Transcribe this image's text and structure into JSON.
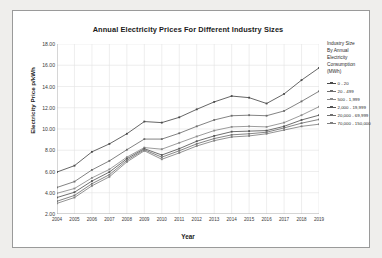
{
  "card": {
    "background": "#ffffff",
    "border_color": "#9a9a9a"
  },
  "chart_data": {
    "type": "line",
    "title": "Annual Electricity Prices For Different Industry Sizes",
    "xlabel": "Year",
    "ylabel": "Electricity Price p/kWh",
    "ylim": [
      2.0,
      18.0
    ],
    "ytick_step": 2.0,
    "grid": true,
    "legend_position": "right",
    "legend_title": "Industry Size\nBy Annual\nElectricity\nConsumption\n(MWh)",
    "x": [
      2004,
      2005,
      2006,
      2007,
      2008,
      2009,
      2010,
      2011,
      2012,
      2013,
      2014,
      2015,
      2016,
      2017,
      2018,
      2019
    ],
    "ytick_labels": [
      "18.00",
      "16.00",
      "14.00",
      "12.00",
      "10.00",
      "8.00",
      "6.00",
      "4.00",
      "2.00"
    ],
    "xtick_labels": [
      "2004",
      "2005",
      "2006",
      "2007",
      "2008",
      "2009",
      "2010",
      "2011",
      "2012",
      "2013",
      "2014",
      "2015",
      "2016",
      "2017",
      "2018",
      "2019"
    ],
    "series": [
      {
        "name": "0 - 20",
        "color": "#4a4a4a",
        "values": [
          5.95,
          6.55,
          7.85,
          8.6,
          9.55,
          10.7,
          10.6,
          11.1,
          11.85,
          12.55,
          13.1,
          12.95,
          12.4,
          13.3,
          14.6,
          15.75
        ]
      },
      {
        "name": "20 - 499",
        "color": "#6d6d6d",
        "values": [
          4.5,
          5.05,
          6.15,
          7.0,
          8.05,
          9.05,
          9.05,
          9.6,
          10.25,
          10.85,
          11.25,
          11.3,
          11.25,
          11.7,
          12.6,
          13.55
        ]
      },
      {
        "name": "500 - 1,999",
        "color": "#8a8a8a",
        "values": [
          3.95,
          4.4,
          5.4,
          6.2,
          7.35,
          8.25,
          8.1,
          8.7,
          9.3,
          9.85,
          10.2,
          10.25,
          10.2,
          10.6,
          11.3,
          12.1
        ]
      },
      {
        "name": "2,000 - 19,999",
        "color": "#555555",
        "values": [
          3.55,
          4.05,
          5.1,
          5.95,
          7.2,
          8.15,
          7.55,
          8.15,
          8.85,
          9.35,
          9.75,
          9.8,
          9.85,
          10.25,
          10.85,
          11.3
        ]
      },
      {
        "name": "20,000 - 69,999",
        "color": "#707070",
        "values": [
          3.2,
          3.75,
          4.85,
          5.7,
          7.05,
          8.05,
          7.35,
          7.95,
          8.6,
          9.1,
          9.45,
          9.55,
          9.7,
          10.1,
          10.55,
          10.9
        ]
      },
      {
        "name": "70,000 - 150,000",
        "color": "#7f7f7f",
        "values": [
          3.0,
          3.55,
          4.65,
          5.5,
          6.9,
          7.95,
          7.15,
          7.75,
          8.4,
          8.9,
          9.25,
          9.35,
          9.55,
          9.9,
          10.25,
          10.45
        ]
      }
    ]
  }
}
